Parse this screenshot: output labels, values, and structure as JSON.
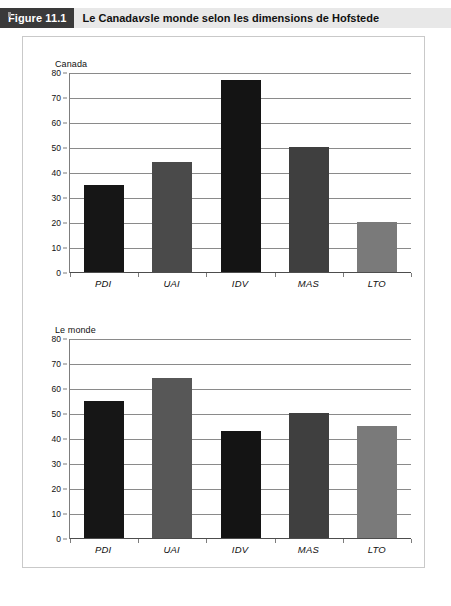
{
  "figure": {
    "tab_label": "Figure 11.1",
    "title_part1": "Le Canada ",
    "title_italic": "vs",
    "title_part2": " le monde selon les dimensions de Hofstede",
    "header_tab_color": "#3a3a3a",
    "header_title_bg": "#e8e8e8"
  },
  "chart_data": [
    {
      "type": "bar",
      "id": "canada",
      "title": "Canada",
      "xlabel": "",
      "ylabel": "",
      "categories": [
        "PDI",
        "UAI",
        "IDV",
        "MAS",
        "LTO"
      ],
      "values": [
        35,
        44,
        77,
        50,
        20
      ],
      "ylim": [
        0,
        80
      ],
      "yticks": [
        0,
        10,
        20,
        30,
        40,
        50,
        60,
        70,
        80
      ],
      "tick_labels": [
        "0",
        "10",
        "20",
        "30",
        "40",
        "50",
        "60",
        "70",
        "80"
      ],
      "grid": true,
      "legend": "none",
      "bar_colors": [
        "#161616",
        "#4a4a4a",
        "#141414",
        "#3f3f3f",
        "#7a7a7a"
      ],
      "bar_hatched": [
        false,
        false,
        true,
        false,
        false
      ]
    },
    {
      "type": "bar",
      "id": "monde",
      "title": "Le monde",
      "xlabel": "",
      "ylabel": "",
      "categories": [
        "PDI",
        "UAI",
        "IDV",
        "MAS",
        "LTO"
      ],
      "values": [
        55,
        64,
        43,
        50,
        45
      ],
      "ylim": [
        0,
        80
      ],
      "yticks": [
        0,
        10,
        20,
        30,
        40,
        50,
        60,
        70,
        80
      ],
      "tick_labels": [
        "0",
        "10",
        "20",
        "30",
        "40",
        "50",
        "60",
        "70",
        "80"
      ],
      "grid": true,
      "legend": "none",
      "bar_colors": [
        "#161616",
        "#575757",
        "#141414",
        "#3f3f3f",
        "#7a7a7a"
      ],
      "bar_hatched": [
        false,
        true,
        true,
        false,
        false
      ]
    }
  ]
}
